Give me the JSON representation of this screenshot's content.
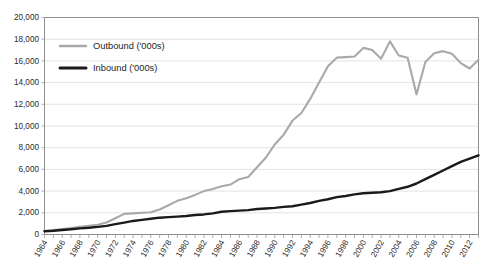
{
  "chart_data": {
    "type": "line",
    "title": "",
    "xlabel": "",
    "ylabel": "",
    "xlim": [
      1964,
      2013
    ],
    "ylim": [
      0,
      20000
    ],
    "ytick_step": 2000,
    "grid": true,
    "legend_position": "top-left-inside",
    "ytick_labels": [
      "20,000",
      "18,000",
      "16,000",
      "14,000",
      "12,000",
      "10,000",
      "8,000",
      "6,000",
      "4,000",
      "2,000",
      "0"
    ],
    "ytick_values": [
      20000,
      18000,
      16000,
      14000,
      12000,
      10000,
      8000,
      6000,
      4000,
      2000,
      0
    ],
    "xtick_labels": [
      "1964",
      "1966",
      "1968",
      "1970",
      "1972",
      "1974",
      "1976",
      "1978",
      "1980",
      "1982",
      "1984",
      "1986",
      "1988",
      "1990",
      "1992",
      "1994",
      "1996",
      "1998",
      "2000",
      "2002",
      "2004",
      "2006",
      "2008",
      "2010",
      "2012"
    ],
    "xtick_values": [
      1964,
      1966,
      1968,
      1970,
      1972,
      1974,
      1976,
      1978,
      1980,
      1982,
      1984,
      1986,
      1988,
      1990,
      1992,
      1994,
      1996,
      1998,
      2000,
      2002,
      2004,
      2006,
      2008,
      2010,
      2012
    ],
    "x": [
      1964,
      1965,
      1966,
      1967,
      1968,
      1969,
      1970,
      1971,
      1972,
      1973,
      1974,
      1975,
      1976,
      1977,
      1978,
      1979,
      1980,
      1981,
      1982,
      1983,
      1984,
      1985,
      1986,
      1987,
      1988,
      1989,
      1990,
      1991,
      1992,
      1993,
      1994,
      1995,
      1996,
      1997,
      1998,
      1999,
      2000,
      2001,
      2002,
      2003,
      2004,
      2005,
      2006,
      2007,
      2008,
      2009,
      2010,
      2011,
      2012,
      2013
    ],
    "series": [
      {
        "name": "Outbound ('000s)",
        "color": "#a9a9a9",
        "width": 2.1,
        "values": [
          300,
          400,
          500,
          600,
          700,
          800,
          900,
          1100,
          1500,
          1900,
          1950,
          2000,
          2050,
          2300,
          2700,
          3100,
          3350,
          3650,
          4000,
          4200,
          4450,
          4600,
          5100,
          5300,
          6200,
          7100,
          8300,
          9200,
          10500,
          11200,
          12500,
          14000,
          15500,
          16300,
          16350,
          16400,
          17200,
          17000,
          16200,
          17800,
          16500,
          16300,
          12900,
          15900,
          16700,
          16900,
          16650,
          15800,
          15300,
          16100
        ]
      },
      {
        "name": "Inbound ('000s)",
        "color": "#1a1a1a",
        "width": 2.4,
        "values": [
          300,
          350,
          420,
          480,
          560,
          620,
          700,
          800,
          950,
          1100,
          1250,
          1350,
          1450,
          1550,
          1600,
          1650,
          1700,
          1800,
          1850,
          1950,
          2100,
          2150,
          2200,
          2250,
          2350,
          2400,
          2450,
          2550,
          2600,
          2750,
          2900,
          3100,
          3250,
          3450,
          3550,
          3700,
          3800,
          3850,
          3900,
          4000,
          4200,
          4400,
          4700,
          5100,
          5500,
          5900,
          6300,
          6700,
          7000,
          7300
        ]
      }
    ],
    "legend": [
      {
        "label": "Outbound ('000s)",
        "color": "#a9a9a9"
      },
      {
        "label": "Inbound ('000s)",
        "color": "#1a1a1a"
      }
    ]
  }
}
